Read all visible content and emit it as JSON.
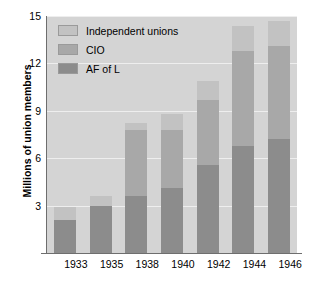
{
  "chart_data": {
    "type": "bar",
    "subtype": "stacked-vertical",
    "title": "",
    "xlabel": "",
    "ylabel": "Millions of union members",
    "categories": [
      "1933",
      "1935",
      "1938",
      "1940",
      "1942",
      "1944",
      "1946"
    ],
    "yticks": [
      "3",
      "6",
      "9",
      "12",
      "15"
    ],
    "ytick_values": [
      3,
      6,
      9,
      12,
      15
    ],
    "ylim": [
      0,
      15
    ],
    "grid": true,
    "grid_axis": "y",
    "legend_position": "top-left inside plot",
    "series": [
      {
        "name": "Independent unions",
        "color": "#c2c2c2",
        "values": [
          0.8,
          0.6,
          0.4,
          1.0,
          1.2,
          1.6,
          1.6
        ]
      },
      {
        "name": "CIO",
        "color": "#a8a8a8",
        "values": [
          0.0,
          0.0,
          4.2,
          3.7,
          4.1,
          6.0,
          5.9
        ]
      },
      {
        "name": "AF of L",
        "color": "#8c8c8c",
        "values": [
          2.1,
          3.0,
          3.6,
          4.1,
          5.6,
          6.8,
          7.2
        ]
      }
    ],
    "totals": [
      2.9,
      3.6,
      8.2,
      8.8,
      10.9,
      14.4,
      14.7
    ],
    "plot_background": "#d4d4d4",
    "gridline_color": "#eeeeee",
    "axis_color": "#6e6e6e"
  },
  "legend": {
    "items": [
      {
        "label": "Independent unions",
        "color": "#c2c2c2"
      },
      {
        "label": "CIO",
        "color": "#a8a8a8"
      },
      {
        "label": "AF of L",
        "color": "#8c8c8c"
      }
    ]
  }
}
